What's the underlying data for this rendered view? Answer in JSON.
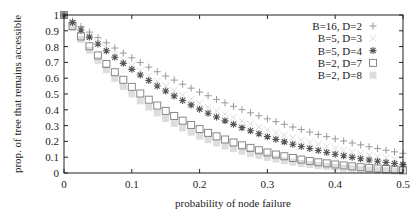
{
  "chart_data": {
    "type": "scatter",
    "title": "",
    "xlabel": "probability of node failure",
    "ylabel": "prop. of tree that remains accessible",
    "xlim": [
      0,
      0.5
    ],
    "ylim": [
      0,
      1
    ],
    "xticks": [
      "0",
      "0.1",
      "0.2",
      "0.3",
      "0.4",
      "0.5"
    ],
    "yticks": [
      "0",
      "0.1",
      "0.2",
      "0.3",
      "0.4",
      "0.5",
      "0.6",
      "0.7",
      "0.8",
      "0.9",
      "1"
    ],
    "grid": false,
    "legend_position": "top-right",
    "x": [
      0,
      0.0125,
      0.025,
      0.0375,
      0.05,
      0.0625,
      0.075,
      0.0875,
      0.1,
      0.1125,
      0.125,
      0.1375,
      0.15,
      0.1625,
      0.175,
      0.1875,
      0.2,
      0.2125,
      0.225,
      0.2375,
      0.25,
      0.2625,
      0.275,
      0.2875,
      0.3,
      0.3125,
      0.325,
      0.3375,
      0.35,
      0.3625,
      0.375,
      0.3875,
      0.4,
      0.4125,
      0.425,
      0.4375,
      0.45,
      0.4625,
      0.475,
      0.4875,
      0.5
    ],
    "series": [
      {
        "name": "B=16, D=2",
        "marker": "plus",
        "color": "#999999",
        "values": [
          1.0,
          0.963,
          0.927,
          0.892,
          0.857,
          0.824,
          0.791,
          0.759,
          0.729,
          0.699,
          0.67,
          0.641,
          0.614,
          0.588,
          0.562,
          0.537,
          0.512,
          0.489,
          0.466,
          0.444,
          0.422,
          0.401,
          0.381,
          0.362,
          0.343,
          0.325,
          0.308,
          0.291,
          0.275,
          0.259,
          0.244,
          0.23,
          0.216,
          0.203,
          0.19,
          0.178,
          0.166,
          0.155,
          0.144,
          0.134,
          0.125
        ]
      },
      {
        "name": "B=5, D=3",
        "marker": "x",
        "color": "#dddddd",
        "values": [
          1.0,
          0.955,
          0.911,
          0.869,
          0.828,
          0.789,
          0.751,
          0.714,
          0.679,
          0.645,
          0.613,
          0.581,
          0.551,
          0.522,
          0.494,
          0.468,
          0.442,
          0.418,
          0.394,
          0.372,
          0.35,
          0.329,
          0.31,
          0.291,
          0.273,
          0.256,
          0.239,
          0.224,
          0.209,
          0.194,
          0.181,
          0.168,
          0.156,
          0.144,
          0.133,
          0.123,
          0.113,
          0.103,
          0.095,
          0.086,
          0.078
        ]
      },
      {
        "name": "B=5, D=4",
        "marker": "asterisk",
        "color": "#555555",
        "values": [
          1.0,
          0.952,
          0.905,
          0.86,
          0.816,
          0.774,
          0.733,
          0.694,
          0.656,
          0.62,
          0.585,
          0.551,
          0.519,
          0.488,
          0.459,
          0.431,
          0.404,
          0.378,
          0.354,
          0.33,
          0.308,
          0.287,
          0.267,
          0.248,
          0.23,
          0.213,
          0.197,
          0.182,
          0.168,
          0.155,
          0.142,
          0.13,
          0.119,
          0.109,
          0.099,
          0.09,
          0.082,
          0.074,
          0.066,
          0.06,
          0.053
        ]
      },
      {
        "name": "B=2, D=7",
        "marker": "square-open",
        "color": "#888888",
        "values": [
          1.0,
          0.93,
          0.864,
          0.802,
          0.744,
          0.69,
          0.638,
          0.59,
          0.545,
          0.503,
          0.464,
          0.427,
          0.393,
          0.361,
          0.331,
          0.304,
          0.278,
          0.254,
          0.232,
          0.212,
          0.193,
          0.175,
          0.159,
          0.144,
          0.13,
          0.117,
          0.106,
          0.095,
          0.085,
          0.076,
          0.068,
          0.061,
          0.054,
          0.048,
          0.042,
          0.037,
          0.032,
          0.028,
          0.025,
          0.021,
          0.018
        ]
      },
      {
        "name": "B=2, D=8",
        "marker": "square-filled",
        "color": "#dddddd",
        "values": [
          1.0,
          0.92,
          0.846,
          0.777,
          0.713,
          0.654,
          0.599,
          0.548,
          0.501,
          0.457,
          0.417,
          0.38,
          0.345,
          0.314,
          0.285,
          0.258,
          0.233,
          0.211,
          0.19,
          0.171,
          0.154,
          0.138,
          0.124,
          0.111,
          0.099,
          0.088,
          0.078,
          0.069,
          0.061,
          0.054,
          0.047,
          0.041,
          0.036,
          0.031,
          0.027,
          0.023,
          0.02,
          0.017,
          0.014,
          0.012,
          0.01
        ]
      }
    ]
  }
}
